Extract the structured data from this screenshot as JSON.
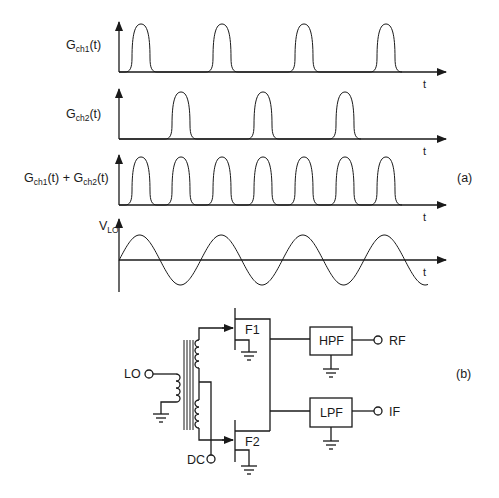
{
  "figure": {
    "panel_a_label": "(a)",
    "panel_b_label": "(b)"
  },
  "waveforms": [
    {
      "id": "gch1",
      "label_main": "G",
      "label_sub": "ch1",
      "label_tail": "(t)",
      "time_axis": "t",
      "pulse_centers_px": [
        141,
        222,
        304,
        386
      ]
    },
    {
      "id": "gch2",
      "label_main": "G",
      "label_sub": "ch2",
      "label_tail": "(t)",
      "time_axis": "t",
      "pulse_centers_px": [
        181,
        263,
        345
      ]
    },
    {
      "id": "gsum",
      "label_a_main": "G",
      "label_a_sub": "ch1",
      "label_a_tail": "(t) + ",
      "label_b_main": "G",
      "label_b_sub": "ch2",
      "label_b_tail": "(t)",
      "time_axis": "t",
      "pulse_centers_px": [
        141,
        181,
        222,
        263,
        304,
        345,
        386
      ]
    },
    {
      "id": "vlo",
      "label_main": "V",
      "label_sub": "LO",
      "time_axis": "t",
      "shape": "sinusoid",
      "cycles": 3.75
    }
  ],
  "circuit": {
    "ports": {
      "lo": "LO",
      "dc": "DC",
      "rf": "RF",
      "if": "IF"
    },
    "transistors": {
      "f1": "F1",
      "f2": "F2"
    },
    "filters": {
      "hpf": "HPF",
      "lpf": "LPF"
    }
  },
  "colors": {
    "ink": "#1a1a1a",
    "background": "#ffffff"
  }
}
